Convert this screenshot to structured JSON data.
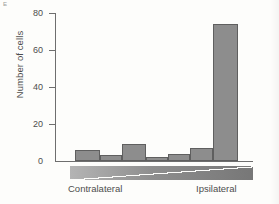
{
  "figure": {
    "panel_letter": "E"
  },
  "chart_data": {
    "type": "bar",
    "title": "",
    "xlabel": "",
    "ylabel": "Number of cells",
    "ylim": [
      0,
      80
    ],
    "yticks": [
      0,
      20,
      40,
      60,
      80
    ],
    "ytick_labels": [
      "0",
      "20",
      "40",
      "60",
      "80"
    ],
    "grid": false,
    "legend": "none",
    "categories": [
      "1",
      "2",
      "3",
      "4",
      "5",
      "6",
      "7"
    ],
    "values": [
      6,
      3.5,
      9,
      2,
      4,
      7,
      74
    ],
    "axis_annotations": {
      "left_label": "Contralateral",
      "right_label": "Ipsilateral",
      "gradient_bar": "contralateral-to-ipsilateral-wedge"
    },
    "bar_color": "#8d8d8d",
    "bar_edge_color": "#5f5f5f",
    "background_color": "#fdfdfb"
  }
}
